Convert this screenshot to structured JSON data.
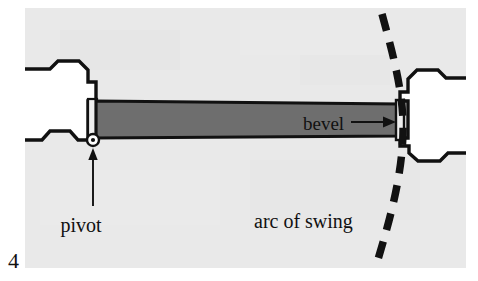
{
  "figure": {
    "number": "4",
    "panel": {
      "background_color": "#e9e9e9",
      "page_background_color": "#ffffff",
      "x": 25,
      "y": 8,
      "width": 441,
      "height": 260
    }
  },
  "labels": {
    "pivot": "pivot",
    "bevel": "bevel",
    "arc_of_swing": "arc of swing"
  },
  "colors": {
    "ink": "#111111",
    "door_fill": "#6e6e6e",
    "door_stroke": "#111111",
    "strip_fill": "#efefef",
    "panel": "#e9e9e9"
  },
  "parts": {
    "door_leaf": {
      "name": "door leaf in plan",
      "fill": "#6e6e6e",
      "left": 96,
      "right": 400,
      "top": 101,
      "bottom": 138
    },
    "left_jamb": {
      "name": "left jamb"
    },
    "right_jamb": {
      "name": "right jamb"
    },
    "pivot_point": {
      "name": "pivot pin",
      "cx": 93,
      "cy": 140,
      "r": 5.5
    },
    "swing_arc": {
      "name": "arc of swing",
      "style": "dashed",
      "dash": "16 11"
    }
  }
}
